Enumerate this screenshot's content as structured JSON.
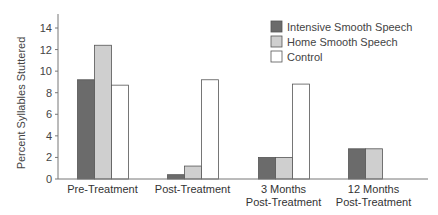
{
  "chart_data": {
    "type": "bar",
    "title": "",
    "xlabel": "",
    "ylabel": "Percent Syllables Stuttered",
    "ylim": [
      0,
      14
    ],
    "yticks": [
      0,
      2,
      4,
      6,
      8,
      10,
      12,
      14
    ],
    "grid": false,
    "legend_position": "top-right",
    "categories": [
      [
        "Pre-Treatment"
      ],
      [
        "Post-Treatment"
      ],
      [
        "3 Months",
        "Post-Treatment"
      ],
      [
        "12 Months",
        "Post-Treatment"
      ]
    ],
    "series": [
      {
        "name": "Intensive Smooth Speech",
        "color": "#6b6b6b",
        "values": [
          9.2,
          0.4,
          2.0,
          2.8
        ]
      },
      {
        "name": "Home Smooth Speech",
        "color": "#cfcfcf",
        "values": [
          12.4,
          1.2,
          2.0,
          2.8
        ]
      },
      {
        "name": "Control",
        "color": "#ffffff",
        "values": [
          8.7,
          9.2,
          8.8,
          null
        ]
      }
    ]
  }
}
